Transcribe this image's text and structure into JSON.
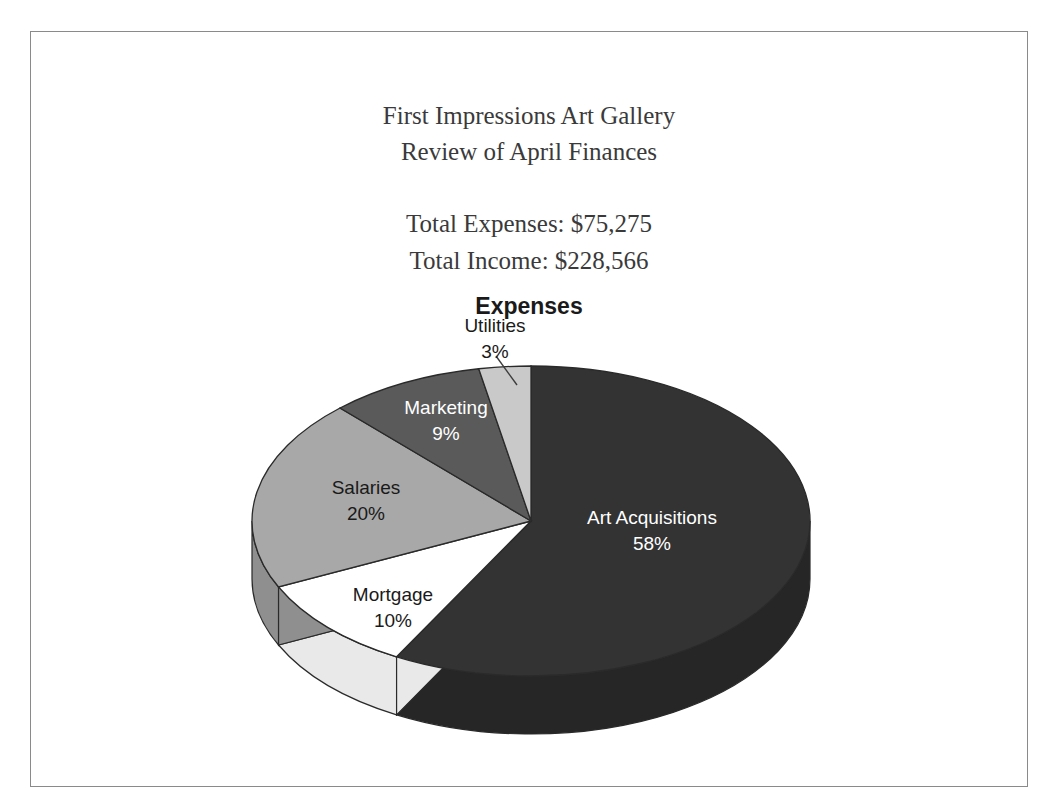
{
  "header": {
    "org_name": "First Impressions Art Gallery",
    "subtitle": "Review of April Finances",
    "total_expenses": "Total Expenses: $75,275",
    "total_income": "Total Income: $228,566"
  },
  "chart_data": {
    "type": "pie",
    "title": "Expenses",
    "style": "3d-pie",
    "categories": [
      "Art Acquisitions",
      "Mortgage",
      "Salaries",
      "Marketing",
      "Utilities"
    ],
    "values": [
      58,
      10,
      20,
      9,
      3
    ],
    "value_suffix": "%",
    "labels": [
      {
        "name": "Art Acquisitions",
        "value": "58%",
        "color": "#333333",
        "side_color": "#262626",
        "text_color": "#ffffff"
      },
      {
        "name": "Mortgage",
        "value": "10%",
        "color": "#ffffff",
        "side_color": "#e9e9e9",
        "text_color": "#1a1a1a"
      },
      {
        "name": "Salaries",
        "value": "20%",
        "color": "#a8a8a8",
        "side_color": "#8f8f8f",
        "text_color": "#1a1a1a"
      },
      {
        "name": "Marketing",
        "value": "9%",
        "color": "#5a5a5a",
        "side_color": "#474747",
        "text_color": "#ffffff"
      },
      {
        "name": "Utilities",
        "value": "3%",
        "color": "#c9c9c9",
        "side_color": "#b0b0b0",
        "text_color": "#1a1a1a"
      }
    ],
    "legend": "none",
    "grid": false,
    "xlabel": "",
    "ylabel": ""
  },
  "colors": {
    "frame_border": "#8a8a8a",
    "page_background": "#ffffff",
    "header_text": "#3a3a3a",
    "title_text": "#1a1a1a"
  }
}
